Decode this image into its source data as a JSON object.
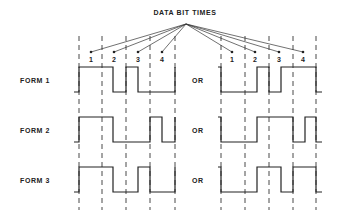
{
  "title": "DATA BIT TIMES",
  "bit_labels": [
    "1",
    "2",
    "3",
    "4"
  ],
  "separator": "OR",
  "forms": [
    {
      "label": "FORM 1",
      "left_bits": [
        1,
        0,
        1,
        0
      ],
      "right_bits": [
        0,
        1,
        0,
        1
      ]
    },
    {
      "label": "FORM 2",
      "left_bits": [
        1,
        0,
        0,
        1
      ],
      "right_bits": [
        0,
        1,
        1,
        0
      ]
    },
    {
      "label": "FORM 3",
      "left_bits": [
        1,
        0,
        1,
        0
      ],
      "right_bits": [
        0,
        1,
        1,
        0
      ]
    }
  ]
}
